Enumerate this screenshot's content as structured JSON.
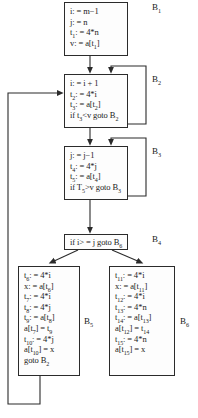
{
  "diagram": {
    "blocks": [
      {
        "id": "B1",
        "label": "B",
        "label_sub": "1",
        "statements": [
          {
            "lhs": "i",
            "op": ":=",
            "rhs": "m−1",
            "text": "i: = m−1"
          },
          {
            "lhs": "j",
            "op": ":=",
            "rhs": "n",
            "text": "j: = n"
          },
          {
            "lhs": "t1",
            "op": ":=",
            "rhs": "4*n",
            "text": "t1: = 4*n"
          },
          {
            "lhs": "v",
            "op": ":=",
            "rhs": "a[t1]",
            "text": "v: = a[t1]"
          }
        ]
      },
      {
        "id": "B2",
        "label": "B",
        "label_sub": "2",
        "statements": [
          {
            "text": "i: = i + 1"
          },
          {
            "text": "t2: = 4*i"
          },
          {
            "text": "t3: = a[t2]"
          },
          {
            "text": "if t3<v goto B2"
          }
        ]
      },
      {
        "id": "B3",
        "label": "B",
        "label_sub": "3",
        "statements": [
          {
            "text": "j: = j−1"
          },
          {
            "text": "t4: = 4*j"
          },
          {
            "text": "t5: = a[t4]"
          },
          {
            "text": "if T5>v goto B3"
          }
        ]
      },
      {
        "id": "B4",
        "label": "B",
        "label_sub": "4",
        "statements": [
          {
            "text": "if i> = j goto B6"
          }
        ]
      },
      {
        "id": "B5",
        "label": "B",
        "label_sub": "5",
        "statements": [
          {
            "text": "t6: = 4*i"
          },
          {
            "text": "x: = a[t6]"
          },
          {
            "text": "t7: = 4*i"
          },
          {
            "text": "t8: = 4*j"
          },
          {
            "text": "t9: = a[t8]"
          },
          {
            "text": "a[t7] = t9"
          },
          {
            "text": "t10: = 4*j"
          },
          {
            "text": "a[t10] = x"
          },
          {
            "text": "goto B2"
          }
        ]
      },
      {
        "id": "B6",
        "label": "B",
        "label_sub": "6",
        "statements": [
          {
            "text": "t11: = 4*i"
          },
          {
            "text": "x: = a[t11]"
          },
          {
            "text": "t12: = 4*i"
          },
          {
            "text": "t13: = 4*n"
          },
          {
            "text": "t14: = a[t13]"
          },
          {
            "text": "a[t12] = t14"
          },
          {
            "text": "t15: = 4*n"
          },
          {
            "text": "a[t15] = x"
          }
        ]
      }
    ],
    "edges": [
      {
        "from": "B1",
        "to": "B2",
        "kind": "fallthrough"
      },
      {
        "from": "B2",
        "to": "B2",
        "kind": "back-edge-right"
      },
      {
        "from": "B2",
        "to": "B3",
        "kind": "fallthrough"
      },
      {
        "from": "B3",
        "to": "B3",
        "kind": "back-edge-right"
      },
      {
        "from": "B3",
        "to": "B4",
        "kind": "fallthrough"
      },
      {
        "from": "B4",
        "to": "B5",
        "kind": "branch-false"
      },
      {
        "from": "B4",
        "to": "B6",
        "kind": "branch-true"
      },
      {
        "from": "B5",
        "to": "B2",
        "kind": "back-edge-left"
      }
    ],
    "colors": {
      "line": "#2b2b2b",
      "text": "#1a1a1a",
      "background": "#ffffff"
    }
  }
}
